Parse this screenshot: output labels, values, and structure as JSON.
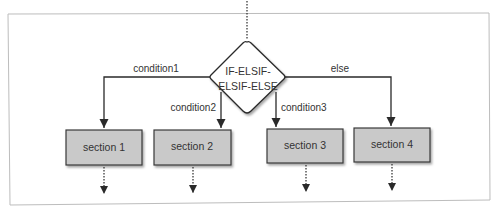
{
  "diagram": {
    "type": "flowchart",
    "decision": {
      "label_lines": [
        "IF-ELSIF-",
        "ELSIF-ELSE"
      ]
    },
    "branches": [
      {
        "condition": "condition1",
        "section": "section 1"
      },
      {
        "condition": "condition2",
        "section": "section 2"
      },
      {
        "condition": "condition3",
        "section": "section 3"
      },
      {
        "condition": "else",
        "section": "section 4"
      }
    ],
    "colors": {
      "frame": "#bdbdbd",
      "box_fill": "#c9c9c9",
      "box_border": "#3a3a3a",
      "line": "#2a2a2a",
      "text": "#333333"
    }
  }
}
